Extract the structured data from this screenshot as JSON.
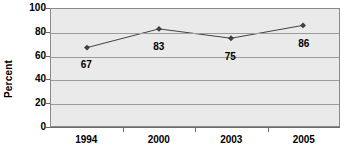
{
  "chart_data": {
    "type": "line",
    "title": "",
    "xlabel": "",
    "ylabel": "Percent",
    "categories": [
      "1994",
      "2000",
      "2003",
      "2005"
    ],
    "values": [
      67,
      83,
      75,
      86
    ],
    "series": [
      {
        "name": "Percent",
        "values": [
          67,
          83,
          75,
          86
        ]
      }
    ],
    "ylim": [
      0,
      100
    ],
    "y_ticks": [
      0,
      20,
      40,
      60,
      80,
      100
    ],
    "y_tick_labels": [
      "0",
      "20",
      "40",
      "60",
      "80",
      "100"
    ],
    "grid": true,
    "legend": "none",
    "data_labels": [
      "67",
      "83",
      "75",
      "86"
    ],
    "marker": "diamond",
    "colors": {
      "line": "#3f3f3f",
      "marker": "#3f3f3f",
      "plot_background": "#eaeaea",
      "gridline": "#9c9c9c",
      "axis": "#6b6b6b",
      "text": "#000000",
      "page_background": "#ffffff"
    }
  }
}
